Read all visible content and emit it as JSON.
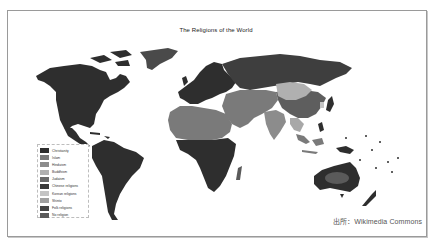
{
  "figure": {
    "title": "The Religions of the World",
    "source_credit": "出所：Wikimedia Commons",
    "caption": ""
  },
  "legend": {
    "items": [
      {
        "label": "Christianity",
        "color": "#2e2e2e"
      },
      {
        "label": "Islam",
        "color": "#7a7a7a"
      },
      {
        "label": "Hinduism",
        "color": "#8c8c8c"
      },
      {
        "label": "Buddhism",
        "color": "#b0b0b0"
      },
      {
        "label": "Judaism",
        "color": "#6a6a6a"
      },
      {
        "label": "Chinese religions",
        "color": "#3a3a3a"
      },
      {
        "label": "Korean religions",
        "color": "#c4c4c4"
      },
      {
        "label": "Shinto",
        "color": "#a0a0a0"
      },
      {
        "label": "Folk religions",
        "color": "#454545"
      },
      {
        "label": "No religion",
        "color": "#5a5a5a"
      }
    ]
  },
  "map": {
    "regions": [
      {
        "name": "North America",
        "religion": "Christianity"
      },
      {
        "name": "Central America",
        "religion": "Christianity"
      },
      {
        "name": "South America",
        "religion": "Christianity"
      },
      {
        "name": "Greenland",
        "religion": "Christianity"
      },
      {
        "name": "Europe",
        "religion": "Christianity"
      },
      {
        "name": "Russia",
        "religion": "Christianity"
      },
      {
        "name": "North Africa",
        "religion": "Islam"
      },
      {
        "name": "Middle East",
        "religion": "Islam"
      },
      {
        "name": "Central Asia",
        "religion": "Islam"
      },
      {
        "name": "Sub-Saharan Africa",
        "religion": "Christianity"
      },
      {
        "name": "India",
        "religion": "Hinduism"
      },
      {
        "name": "China",
        "religion": "Chinese religions"
      },
      {
        "name": "Mongolia",
        "religion": "Buddhism"
      },
      {
        "name": "Southeast Asia",
        "religion": "Buddhism"
      },
      {
        "name": "Indonesia",
        "religion": "Islam"
      },
      {
        "name": "Japan",
        "religion": "Shinto"
      },
      {
        "name": "Australia",
        "religion": "Christianity"
      },
      {
        "name": "Central Australia",
        "religion": "Folk religions"
      },
      {
        "name": "New Zealand",
        "religion": "Christianity"
      }
    ]
  }
}
